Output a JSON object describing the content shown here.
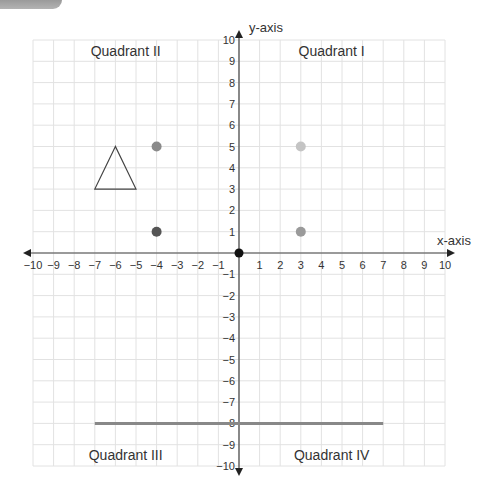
{
  "chart_data": {
    "type": "scatter",
    "title": "",
    "xlabel": "x-axis",
    "ylabel": "y-axis",
    "xlim": [
      -10,
      10
    ],
    "ylim": [
      -10,
      10
    ],
    "grid": true,
    "x_ticks": [
      -10,
      -9,
      -8,
      -7,
      -6,
      -5,
      -4,
      -3,
      -2,
      -1,
      1,
      2,
      3,
      4,
      5,
      6,
      7,
      8,
      9,
      10
    ],
    "y_ticks": [
      10,
      9,
      8,
      7,
      6,
      5,
      4,
      3,
      2,
      1,
      -1,
      -2,
      -3,
      -4,
      -5,
      -6,
      -7,
      -8,
      -9,
      -10
    ],
    "quadrant_labels": [
      {
        "label": "Quadrant II",
        "x": -5.5,
        "y": 9.5
      },
      {
        "label": "Quadrant I",
        "x": 4.5,
        "y": 9.5
      },
      {
        "label": "Quadrant III",
        "x": -5.5,
        "y": -9.5
      },
      {
        "label": "Quadrant IV",
        "x": 4.5,
        "y": -9.5
      }
    ],
    "points": [
      {
        "x": 0,
        "y": 0,
        "color": "#111111",
        "label": "origin"
      },
      {
        "x": -4,
        "y": 5,
        "color": "#8a8a8a"
      },
      {
        "x": -4,
        "y": 1,
        "color": "#555555"
      },
      {
        "x": 3,
        "y": 5,
        "color": "#c4c4c4"
      },
      {
        "x": 3,
        "y": 1,
        "color": "#9a9a9a"
      }
    ],
    "shapes": [
      {
        "type": "triangle",
        "vertices": [
          [
            -6,
            5
          ],
          [
            -7,
            3
          ],
          [
            -5,
            3
          ]
        ],
        "stroke": "#444444",
        "fill": "none"
      },
      {
        "type": "segment",
        "from": [
          -7,
          -8
        ],
        "to": [
          7,
          -8
        ],
        "stroke": "#888888",
        "width": 3
      }
    ]
  }
}
